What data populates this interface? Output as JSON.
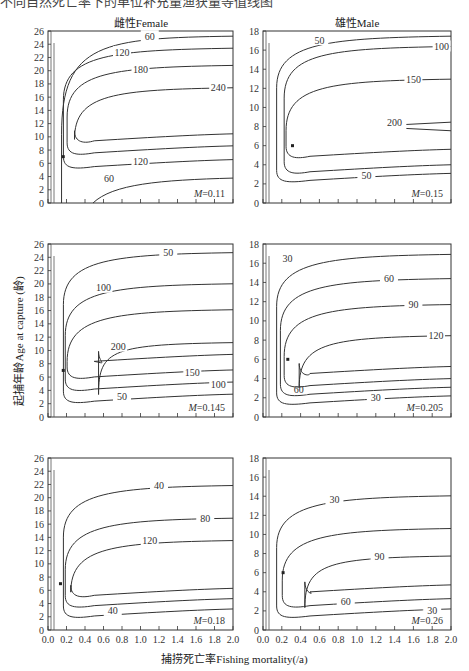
{
  "caption_fragment": "不同自然死亡率下的单位补充量渔获量等值线图",
  "columns": [
    "雌性Female",
    "雄性Male"
  ],
  "xlabel": "捕捞死亡率Fishing mortality(/a)",
  "ylabel": "起捕年龄Age at capture (龄)",
  "chart_data": [
    {
      "type": "contour",
      "title": "雌性Female",
      "annotation": "M=0.11",
      "M": 0.11,
      "xlim": [
        0,
        2.0
      ],
      "ylim": [
        0,
        26
      ],
      "xticks": [
        0.0,
        0.2,
        0.4,
        0.6,
        0.8,
        1.0,
        1.2,
        1.4,
        1.6,
        1.8,
        2.0
      ],
      "yticks": [
        0,
        2,
        4,
        6,
        8,
        10,
        12,
        14,
        16,
        18,
        20,
        22,
        24,
        26
      ],
      "contour_levels": [
        60,
        120,
        180,
        240
      ],
      "optimum_point": {
        "F": 0.1,
        "age": 7
      }
    },
    {
      "type": "contour",
      "title": "雄性Male",
      "annotation": "M=0.15",
      "M": 0.15,
      "xlim": [
        0,
        2.0
      ],
      "ylim": [
        0,
        18
      ],
      "xticks": [
        0.0,
        0.2,
        0.4,
        0.6,
        0.8,
        1.0,
        1.2,
        1.4,
        1.6,
        1.8,
        2.0
      ],
      "yticks": [
        0,
        2,
        4,
        6,
        8,
        10,
        12,
        14,
        16,
        18
      ],
      "contour_levels": [
        50,
        100,
        150,
        200
      ],
      "optimum_point": {
        "F": 0.25,
        "age": 6
      }
    },
    {
      "type": "contour",
      "title": "雌性Female",
      "annotation": "M=0.145",
      "M": 0.145,
      "xlim": [
        0,
        2.0
      ],
      "ylim": [
        0,
        26
      ],
      "xticks": [
        0.0,
        0.2,
        0.4,
        0.6,
        0.8,
        1.0,
        1.2,
        1.4,
        1.6,
        1.8,
        2.0
      ],
      "yticks": [
        0,
        2,
        4,
        6,
        8,
        10,
        12,
        14,
        16,
        18,
        20,
        22,
        24,
        26
      ],
      "contour_levels": [
        50,
        100,
        150,
        200
      ],
      "optimum_point": {
        "F": 0.1,
        "age": 7
      }
    },
    {
      "type": "contour",
      "title": "雄性Male",
      "annotation": "M=0.205",
      "M": 0.205,
      "xlim": [
        0,
        2.0
      ],
      "ylim": [
        0,
        18
      ],
      "xticks": [
        0.0,
        0.2,
        0.4,
        0.6,
        0.8,
        1.0,
        1.2,
        1.4,
        1.6,
        1.8,
        2.0
      ],
      "yticks": [
        0,
        2,
        4,
        6,
        8,
        10,
        12,
        14,
        16,
        18
      ],
      "contour_levels": [
        30,
        60,
        90,
        120
      ],
      "optimum_point": {
        "F": 0.2,
        "age": 6
      }
    },
    {
      "type": "contour",
      "title": "雌性Female",
      "annotation": "M=0.18",
      "M": 0.18,
      "xlim": [
        0,
        2.0
      ],
      "ylim": [
        0,
        26
      ],
      "xticks": [
        0.0,
        0.2,
        0.4,
        0.6,
        0.8,
        1.0,
        1.2,
        1.4,
        1.6,
        1.8,
        2.0
      ],
      "yticks": [
        0,
        2,
        4,
        6,
        8,
        10,
        12,
        14,
        16,
        18,
        20,
        22,
        24,
        26
      ],
      "contour_levels": [
        40,
        80,
        120
      ],
      "optimum_point": {
        "F": 0.07,
        "age": 7
      }
    },
    {
      "type": "contour",
      "title": "雄性Male",
      "annotation": "M=0.26",
      "M": 0.26,
      "xlim": [
        0,
        2.0
      ],
      "ylim": [
        0,
        18
      ],
      "xticks": [
        0.0,
        0.2,
        0.4,
        0.6,
        0.8,
        1.0,
        1.2,
        1.4,
        1.6,
        1.8,
        2.0
      ],
      "yticks": [
        0,
        2,
        4,
        6,
        8,
        10,
        12,
        14,
        16,
        18
      ],
      "contour_levels": [
        30,
        60,
        90
      ],
      "optimum_point": {
        "F": 0.15,
        "age": 6
      }
    }
  ]
}
